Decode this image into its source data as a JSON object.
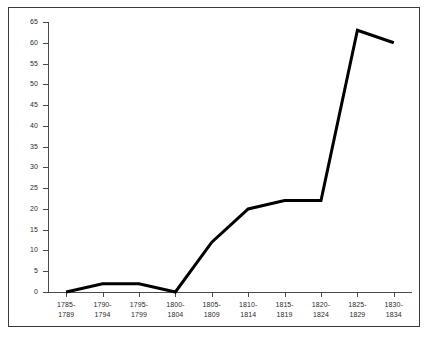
{
  "chart_data": {
    "type": "line",
    "title": "",
    "subtitle": "",
    "xlabel": "",
    "ylabel": "",
    "categories": [
      "1785-1789",
      "1790-1794",
      "1795-1799",
      "1800-1804",
      "1805-1809",
      "1810-1814",
      "1815-1819",
      "1820-1824",
      "1825-1829",
      "1830-1834"
    ],
    "category_lines": [
      [
        "1785-",
        "1789"
      ],
      [
        "1790-",
        "1794"
      ],
      [
        "1795-",
        "1799"
      ],
      [
        "1800-",
        "1804"
      ],
      [
        "1805-",
        "1809"
      ],
      [
        "1810-",
        "1814"
      ],
      [
        "1815-",
        "1819"
      ],
      [
        "1820-",
        "1824"
      ],
      [
        "1825-",
        "1829"
      ],
      [
        "1830-",
        "1834"
      ]
    ],
    "values": [
      0,
      2,
      2,
      0,
      12,
      20,
      22,
      22,
      63,
      60
    ],
    "series": [
      {
        "name": "",
        "values": [
          0,
          2,
          2,
          0,
          12,
          20,
          22,
          22,
          63,
          60
        ],
        "color": "#000000"
      }
    ],
    "ylim": [
      0,
      65
    ],
    "ytick_values": [
      0,
      5,
      10,
      15,
      20,
      25,
      30,
      35,
      40,
      45,
      50,
      55,
      60,
      65
    ],
    "ytick_labels": [
      "0",
      "5",
      "10",
      "15",
      "20",
      "25",
      "30",
      "35",
      "40",
      "45",
      "50",
      "55",
      "60",
      "65"
    ],
    "grid": false,
    "legend": null,
    "legend_position": "none",
    "annotations": [],
    "colors": {
      "line": "#000000",
      "axis": "#4a4a4a",
      "text": "#2b2b2b",
      "background": "#ffffff",
      "frame": "#3a3a3a"
    }
  }
}
